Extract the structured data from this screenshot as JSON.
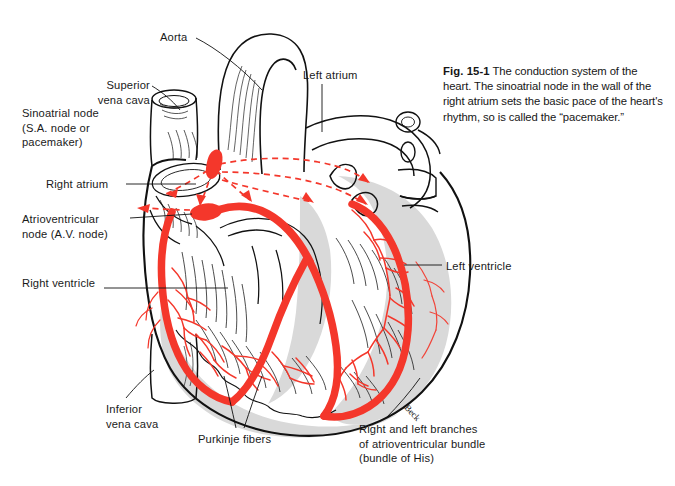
{
  "figure": {
    "number": "Fig. 15-1",
    "caption": " The conduction system of the heart. The sinoatrial node in the wall of the right atrium sets the basic pace of the heart's rhythm, so is called the “pacemaker.”"
  },
  "labels": {
    "aorta": "Aorta",
    "superior_vena_cava": "Superior\nvena cava",
    "sinoatrial_node": "Sinoatrial node\n(S.A. node or\npacemaker)",
    "right_atrium": "Right atrium",
    "atrioventricular_node": "Atrioventricular\nnode (A.V. node)",
    "right_ventricle": "Right ventricle",
    "inferior_vena_cava": "Inferior\nvena cava",
    "purkinje_fibers": "Purkinje fibers",
    "bundle_branches": "Right and left branches\nof atrioventricular bundle\n(bundle of His)",
    "left_atrium": "Left atrium",
    "left_ventricle": "Left ventricle"
  },
  "artist_signature": "Beck",
  "colors": {
    "conduction_red": "#f4372b",
    "ink_black": "#111111",
    "ventricle_gray": "#d9d9d9",
    "background": "#ffffff"
  }
}
